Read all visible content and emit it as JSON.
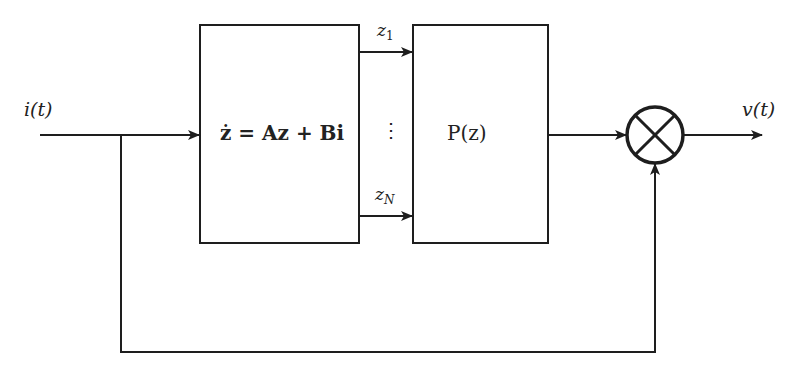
{
  "diagram": {
    "type": "block-diagram",
    "input_label": "i(t)",
    "output_label": "v(t)",
    "blocks": [
      {
        "id": "state-space",
        "label": "ż = Az + Bi"
      },
      {
        "id": "nonlinear",
        "label": "P(z)"
      }
    ],
    "signals": [
      {
        "label": "z",
        "sub": "1"
      },
      {
        "label": "z",
        "sub": "N"
      }
    ],
    "ellipsis": "⋮",
    "multiplier_symbol": "multiply-junction",
    "colors": {
      "line": "#1e1e1e",
      "background": "#ffffff"
    }
  }
}
